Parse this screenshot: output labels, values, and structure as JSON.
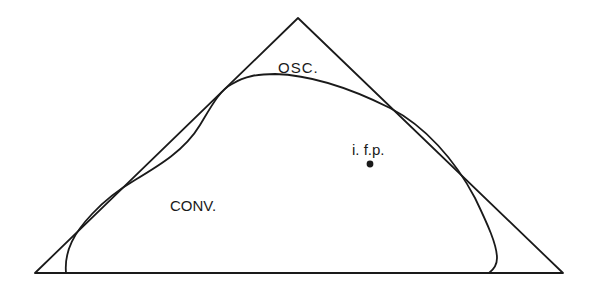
{
  "diagram": {
    "type": "phase-region-triangle",
    "labels": {
      "oscillatory": "OSC.",
      "convergent": "CONV.",
      "point": "i. f.p."
    },
    "colors": {
      "line": "#1a1a1a",
      "background": "#ffffff"
    }
  }
}
